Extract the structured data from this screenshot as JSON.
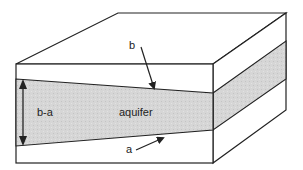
{
  "diagram": {
    "labels": {
      "thickness": "b-a",
      "layer": "aquifer",
      "top_surface": "b",
      "bottom_surface": "a"
    },
    "colors": {
      "stroke": "#222222",
      "aquifer_fill": "#d6d6d6",
      "block_fill": "#ffffff"
    }
  }
}
